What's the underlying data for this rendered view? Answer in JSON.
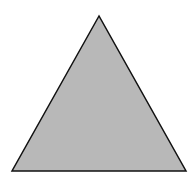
{
  "diagram": {
    "shape": "equilateral-triangle",
    "fill": "#b8b8b8",
    "stroke": "#111111",
    "stroke_width": 1.5,
    "vertices": [
      [
        99,
        16
      ],
      [
        12,
        171
      ],
      [
        186,
        171
      ]
    ]
  }
}
